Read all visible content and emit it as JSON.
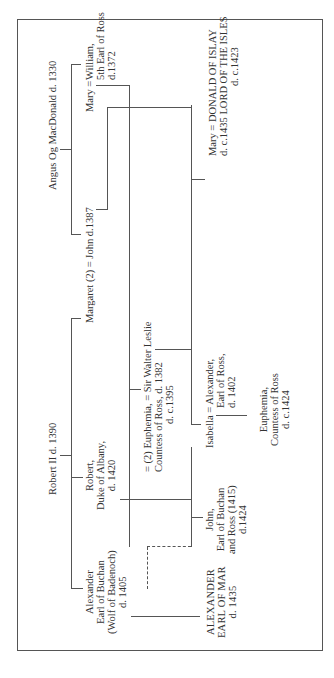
{
  "diagram": {
    "type": "family-tree",
    "orientation": "rotated-90-ccw",
    "people": {
      "angus": "Angus Og MacDonald d. 1330",
      "mary_top": "Mary =",
      "william": [
        "William,",
        "5th Earl of Ross",
        "d.1372"
      ],
      "margaret": "Margaret (2) = John d.1387",
      "robert2": "Robert II d. 1390",
      "euphemia1": [
        "= (2) Euphemia, = Sir Walter Leslie",
        "Countess of Ross,  d. 1382",
        "d. c.1395"
      ],
      "robert_albany": [
        "Robert,",
        "Duke of Albany,",
        "d. 1420"
      ],
      "alexander_buchan": [
        "Alexander",
        "Earl of Buchan",
        "(Wolf of Badenoch)",
        "d. 1405"
      ],
      "mary_donald": [
        "Mary = DONALD OF ISLAY",
        "d. c.1435   LORD OF THE ISLES",
        "d. c.1423"
      ],
      "isabella": [
        "Isabella = Alexander,",
        "Earl of Ross,",
        "d. 1402"
      ],
      "euphemia2": [
        "Euphemia,",
        "Countess of Ross",
        "d. c.1424"
      ],
      "john_buchan": [
        "John,",
        "Earl of Buchan",
        "and Ross (1415)",
        "d.1424"
      ],
      "alexander_mar": [
        "ALEXANDER",
        "EARL OF MAR",
        "d. 1435"
      ]
    }
  }
}
